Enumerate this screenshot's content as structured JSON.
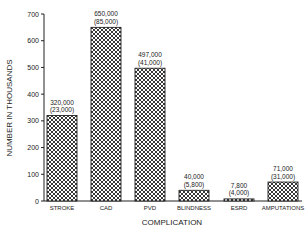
{
  "chart_data": {
    "type": "bar",
    "title": "",
    "xlabel": "COMPLICATION",
    "ylabel": "NUMBER IN THOUSANDS",
    "ylim": [
      0,
      700
    ],
    "yticks": [
      0,
      100,
      200,
      300,
      400,
      500,
      600,
      700
    ],
    "grid": false,
    "legend": null,
    "categories": [
      "STROKE",
      "CAD",
      "PVD",
      "BLINDNESS",
      "ESRD",
      "AMPUTATIONS"
    ],
    "values": [
      320,
      650,
      497,
      40,
      7.8,
      71
    ],
    "annotations": [
      {
        "category": "STROKE",
        "line1": "320,000",
        "line2": "(23,000)"
      },
      {
        "category": "CAD",
        "line1": "650,000",
        "line2": "(85,000)"
      },
      {
        "category": "PVD",
        "line1": "497,000",
        "line2": "(41,000)"
      },
      {
        "category": "BLINDNESS",
        "line1": "40,000",
        "line2": "(5,800)"
      },
      {
        "category": "ESRD",
        "line1": "7,800",
        "line2": "(4,000)"
      },
      {
        "category": "AMPUTATIONS",
        "line1": "71,000",
        "line2": "(31,000)"
      }
    ]
  },
  "colors": {
    "ink": "#222222",
    "background": "#ffffff"
  }
}
